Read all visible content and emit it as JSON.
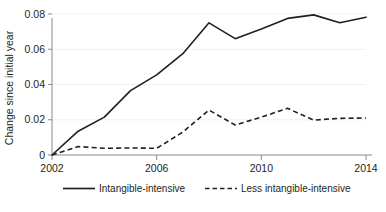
{
  "chart_data": {
    "type": "line",
    "title": "",
    "subtitle": "",
    "xlabel": "",
    "ylabel": "Change since initial year",
    "x": [
      2002,
      2003,
      2004,
      2005,
      2006,
      2007,
      2008,
      2009,
      2010,
      2011,
      2012,
      2013,
      2014
    ],
    "xlim": [
      2002,
      2014
    ],
    "ylim": [
      0,
      0.08
    ],
    "xticks": [
      2002,
      2006,
      2010,
      2014
    ],
    "xtick_labels": [
      "2002",
      "2006",
      "2010",
      "2014"
    ],
    "yticks": [
      0,
      0.02,
      0.04,
      0.06,
      0.08
    ],
    "ytick_labels": [
      "0",
      "0.02",
      "0.04",
      "0.06",
      "0.08"
    ],
    "grid": true,
    "grid_axis": "y",
    "legend_position": "bottom",
    "series": [
      {
        "name": "Intangible-intensive",
        "style": "solid",
        "color": "#231f20",
        "values": [
          0.0,
          0.0135,
          0.0215,
          0.0365,
          0.0455,
          0.0575,
          0.075,
          0.066,
          0.0715,
          0.0775,
          0.0795,
          0.075,
          0.0782
        ]
      },
      {
        "name": "Less intangible-intensive",
        "style": "dashed",
        "color": "#231f20",
        "values": [
          0.0,
          0.0048,
          0.0038,
          0.004,
          0.0038,
          0.013,
          0.0255,
          0.017,
          0.0215,
          0.0265,
          0.0198,
          0.0208,
          0.021
        ]
      }
    ]
  },
  "legend": {
    "items": [
      {
        "label": "Intangible-intensive",
        "style": "solid"
      },
      {
        "label": "Less intangible-intensive",
        "style": "dashed"
      }
    ]
  },
  "colors": {
    "ink": "#231f20",
    "axis": "#8a8a8a",
    "grid": "#f0f0f0",
    "background": "#ffffff"
  }
}
